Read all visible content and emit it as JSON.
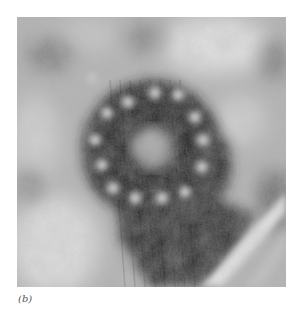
{
  "figure": {
    "label": "(b)",
    "colors": {
      "background_light": "#d8d8d8",
      "mid_gray": "#9a9a9a",
      "dark_ring": "#1c1c1c",
      "bright_dot": "#e6e6e6"
    }
  }
}
